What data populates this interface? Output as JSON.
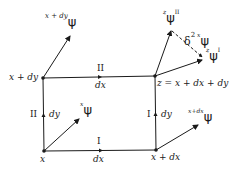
{
  "diagram": {
    "type": "parallel-transport-loop",
    "nodes": {
      "bl": {
        "label": "x"
      },
      "br": {
        "label": "x + dx"
      },
      "tl": {
        "label": "x + dy"
      },
      "tr": {
        "label": "z = x + dx + dy"
      }
    },
    "edges": {
      "bottom": {
        "roman": "I",
        "label": "dx"
      },
      "right": {
        "roman": "I",
        "label": "dy"
      },
      "left": {
        "roman": "II",
        "label": "dy"
      },
      "top": {
        "roman": "II",
        "label": "dx"
      }
    },
    "vectors": {
      "at_x": {
        "superscript": "x",
        "symbol": "ψ"
      },
      "at_x_dx": {
        "superscript": "x+dx",
        "symbol": "ψ"
      },
      "at_x_dy": {
        "superscript": "x + dy",
        "symbol": "ψ"
      },
      "at_z_I": {
        "superscript": "z",
        "symbol": "ψ",
        "suffix": "I"
      },
      "at_z_II": {
        "superscript": "z",
        "symbol": "ψ",
        "suffix": "II"
      }
    },
    "difference": {
      "prefix": "δ",
      "power": "2",
      "superscript": "x",
      "symbol": "ψ"
    },
    "colors": {
      "ink": "#1a1a1a",
      "background": "#ffffff"
    }
  }
}
